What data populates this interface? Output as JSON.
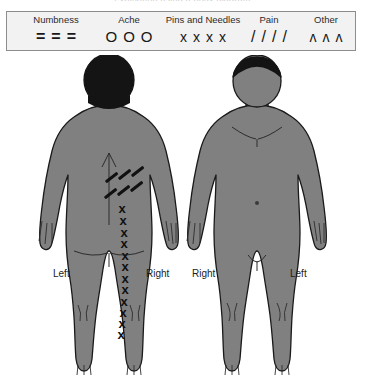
{
  "caption": "evaluation using a  body diagram",
  "legend": {
    "items": [
      {
        "label": "Numbness",
        "symbol": "=",
        "count": 3,
        "glyph_class": "sym-eq",
        "name": "numbness",
        "x": 10,
        "w": 78
      },
      {
        "label": "Ache",
        "symbol": "O",
        "count": 3,
        "glyph_class": "sym-o",
        "name": "ache",
        "x": 88,
        "w": 68
      },
      {
        "label": "Pins and Needles",
        "symbol": "x",
        "count": 4,
        "glyph_class": "sym-x",
        "name": "pins-and-needles",
        "x": 152,
        "w": 88
      },
      {
        "label": "Pain",
        "symbol": "/",
        "count": 4,
        "glyph_class": "sym-sl",
        "name": "pain",
        "x": 228,
        "w": 68
      },
      {
        "label": "Other",
        "symbol": "ʌ",
        "count": 3,
        "glyph_class": "sym-car",
        "name": "other",
        "x": 288,
        "w": 62
      }
    ]
  },
  "figures": {
    "back": {
      "title": "back-view-body",
      "left_label": "Left",
      "right_label": "Right"
    },
    "front": {
      "title": "front-view-body",
      "left_label": "Right",
      "right_label": "Left"
    }
  },
  "colors": {
    "body_fill": "#808080",
    "body_outline": "#1a1a1a",
    "hair": "#141414",
    "legend_bg": "#f2f2f2",
    "legend_border": "#8d8d8d",
    "mark": "#111111",
    "page_bg": "#ffffff"
  },
  "annotations": {
    "pain_slashes": {
      "symbol": "/",
      "region": "right lower back",
      "count": 6,
      "items": [
        {
          "x": 104,
          "y": 176,
          "len": 15,
          "angle": -38
        },
        {
          "x": 117,
          "y": 173,
          "len": 15,
          "angle": -38
        },
        {
          "x": 130,
          "y": 170,
          "len": 15,
          "angle": -38
        },
        {
          "x": 103,
          "y": 192,
          "len": 15,
          "angle": -38
        },
        {
          "x": 116,
          "y": 189,
          "len": 15,
          "angle": -38
        },
        {
          "x": 129,
          "y": 185,
          "len": 15,
          "angle": -38
        }
      ]
    },
    "pins_needles_x": {
      "symbol": "x",
      "region": "right buttock down right leg to ankle",
      "count": 12,
      "items": [
        {
          "x": 122,
          "y": 209
        },
        {
          "x": 123,
          "y": 221
        },
        {
          "x": 124,
          "y": 233
        },
        {
          "x": 124,
          "y": 244
        },
        {
          "x": 125,
          "y": 256
        },
        {
          "x": 125,
          "y": 267
        },
        {
          "x": 125,
          "y": 279
        },
        {
          "x": 125,
          "y": 290
        },
        {
          "x": 124,
          "y": 302
        },
        {
          "x": 123,
          "y": 313
        },
        {
          "x": 122,
          "y": 324
        },
        {
          "x": 121,
          "y": 335
        }
      ]
    }
  }
}
